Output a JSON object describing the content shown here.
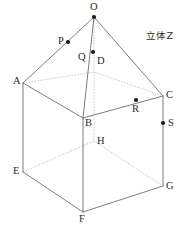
{
  "figure": {
    "caption": "立体Z",
    "caption_position": {
      "x": 146,
      "y": 31
    },
    "canvas": {
      "width": 191,
      "height": 237
    },
    "colors": {
      "background": "#ffffff",
      "edge_visible": "#6e6e6e",
      "edge_hidden": "#b4b4b4",
      "point_marker": "#1a1a1a",
      "label_text": "#2b2b2b"
    },
    "vertices": [
      {
        "id": "O",
        "label": "O",
        "x": 94,
        "y": 17,
        "dot": true,
        "label_x": 90,
        "label_y": 2
      },
      {
        "id": "A",
        "label": "A",
        "x": 23,
        "y": 83,
        "dot": false,
        "label_x": 13,
        "label_y": 76
      },
      {
        "id": "B",
        "label": "B",
        "x": 83,
        "y": 118,
        "dot": false,
        "label_x": 85,
        "label_y": 118
      },
      {
        "id": "C",
        "label": "C",
        "x": 163,
        "y": 96,
        "dot": false,
        "label_x": 166,
        "label_y": 90
      },
      {
        "id": "D",
        "label": "D",
        "x": 94,
        "y": 72,
        "dot": false,
        "label_x": 97,
        "label_y": 56
      },
      {
        "id": "E",
        "label": "E",
        "x": 23,
        "y": 172,
        "dot": false,
        "label_x": 13,
        "label_y": 166
      },
      {
        "id": "F",
        "label": "F",
        "x": 83,
        "y": 212,
        "dot": false,
        "label_x": 79,
        "label_y": 214
      },
      {
        "id": "G",
        "label": "G",
        "x": 163,
        "y": 186,
        "dot": false,
        "label_x": 166,
        "label_y": 181
      },
      {
        "id": "H",
        "label": "H",
        "x": 94,
        "y": 141,
        "dot": false,
        "label_x": 97,
        "label_y": 136
      },
      {
        "id": "P",
        "label": "P",
        "x": 68,
        "y": 42,
        "dot": true,
        "label_x": 58,
        "label_y": 36
      },
      {
        "id": "Q",
        "label": "Q",
        "x": 93,
        "y": 52,
        "dot": true,
        "label_x": 78,
        "label_y": 52
      },
      {
        "id": "R",
        "label": "R",
        "x": 136,
        "y": 100,
        "dot": true,
        "label_x": 132,
        "label_y": 104
      },
      {
        "id": "S",
        "label": "S",
        "x": 163,
        "y": 123,
        "dot": true,
        "label_x": 168,
        "label_y": 118
      }
    ],
    "edges_visible": [
      {
        "from": "O",
        "to": "A"
      },
      {
        "from": "O",
        "to": "B"
      },
      {
        "from": "O",
        "to": "C"
      },
      {
        "from": "A",
        "to": "B"
      },
      {
        "from": "B",
        "to": "C"
      },
      {
        "from": "A",
        "to": "E"
      },
      {
        "from": "B",
        "to": "F"
      },
      {
        "from": "C",
        "to": "G"
      },
      {
        "from": "E",
        "to": "F"
      },
      {
        "from": "F",
        "to": "G"
      }
    ],
    "edges_hidden": [
      {
        "from": "O",
        "to": "D"
      },
      {
        "from": "A",
        "to": "D"
      },
      {
        "from": "D",
        "to": "C"
      },
      {
        "from": "D",
        "to": "H"
      },
      {
        "from": "E",
        "to": "H"
      },
      {
        "from": "H",
        "to": "G"
      }
    ],
    "marked_points": [
      "P",
      "Q",
      "R",
      "S"
    ],
    "apex": "O"
  }
}
